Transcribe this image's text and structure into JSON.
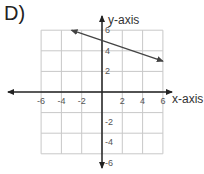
{
  "title": "D)",
  "chart_data": {
    "type": "line",
    "title": "D)",
    "xlabel": "x-axis",
    "ylabel": "y-axis",
    "xlim": [
      -6,
      6
    ],
    "ylim": [
      -6,
      6
    ],
    "grid": true,
    "x_ticks": [
      "-6",
      "-4",
      "-2",
      "2",
      "4",
      "6"
    ],
    "y_ticks": [
      "6",
      "4",
      "2",
      "-2",
      "-4",
      "-6"
    ],
    "series": [
      {
        "name": "line",
        "x": [
          -3,
          6
        ],
        "y": [
          6,
          3
        ],
        "arrows": "both"
      }
    ]
  },
  "colors": {
    "grid": "#c8c8c8",
    "axis": "#222222",
    "line": "#444444"
  }
}
